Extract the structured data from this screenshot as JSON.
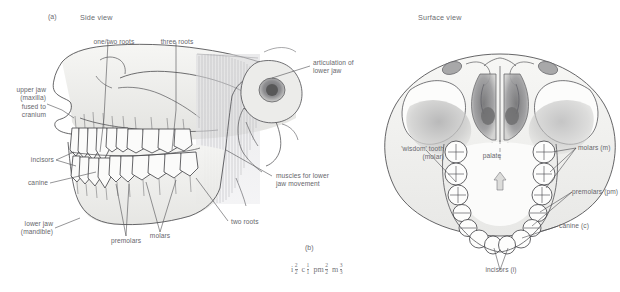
{
  "figure": {
    "panel_a": {
      "tag": "(a)",
      "title": "Side view",
      "labels": {
        "one_two_roots": "one/two roots",
        "three_roots": "three roots",
        "articulation": "articulation of\nlower jaw",
        "upper_jaw": "upper jaw\n(maxilla)\nfused to\ncranium",
        "incisors": "incisors",
        "canine": "canine",
        "lower_jaw": "lower jaw\n(mandible)",
        "premolars": "premolars",
        "molars": "molars",
        "two_roots": "two roots",
        "muscles": "muscles for lower\njaw movement"
      }
    },
    "panel_b": {
      "title": "Surface view",
      "labels": {
        "wisdom_tooth": "'wisdom' tooth\n(molar)",
        "palate": "palate",
        "molars": "molars (m)",
        "premolars": "premolars (pm)",
        "canine": "canine (c)",
        "incisors": "incisors (i)"
      }
    },
    "panel_c": {
      "tag": "(b)",
      "dental_formula": [
        {
          "symbol": "i",
          "numerator": "2",
          "denominator": "2"
        },
        {
          "symbol": "c",
          "numerator": "1",
          "denominator": "1"
        },
        {
          "symbol": "pm",
          "numerator": "2",
          "denominator": "2"
        },
        {
          "symbol": "m",
          "numerator": "3",
          "denominator": "3"
        }
      ]
    },
    "colors": {
      "ink": "#3c3c40",
      "text": "#66666b",
      "bone_light": "#f2f2f0",
      "bone_mid": "#dcdcda",
      "bone_shade": "#c2c2c0",
      "muscle": "#d7d7d9",
      "socket_dark": "#7e7e80"
    }
  }
}
